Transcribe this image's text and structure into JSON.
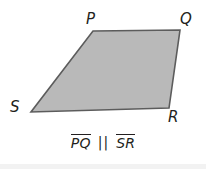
{
  "figure": {
    "type": "quadrilateral-trapezoid",
    "fill_color": "#b9b9b9",
    "stroke_color": "#5c5c5c",
    "background_color": "#ffffff",
    "label_color": "#231f20",
    "points": "93,31 180,30 169,108 31,112",
    "vertices": [
      {
        "name": "P",
        "label": "P",
        "x": 93,
        "y": 31
      },
      {
        "name": "Q",
        "label": "Q",
        "x": 180,
        "y": 30
      },
      {
        "name": "R",
        "label": "R",
        "x": 169,
        "y": 108
      },
      {
        "name": "S",
        "label": "S",
        "x": 31,
        "y": 112
      }
    ]
  },
  "caption": {
    "segment_1": "PQ",
    "relation_symbol": "||",
    "segment_2": "SR",
    "full_text": "PQ || SR"
  }
}
